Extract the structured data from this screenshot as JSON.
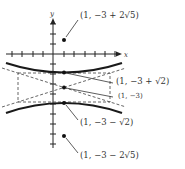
{
  "figure": {
    "type": "hyperbola-graph",
    "axes": {
      "x_label": "x",
      "y_label": "y"
    },
    "equation_center": "(1, -3)",
    "points": [
      {
        "id": "focus-top",
        "label": "(1, −3 + 2√5)"
      },
      {
        "id": "vertex-top",
        "label": "(1, −3 + √2)"
      },
      {
        "id": "center",
        "label": "(1, −3)"
      },
      {
        "id": "vertex-bottom",
        "label": "(1, −3 − √2)"
      },
      {
        "id": "focus-bottom",
        "label": "(1, −3 − 2√5)"
      }
    ]
  },
  "colors": {
    "curve": "#1a1a1a",
    "dashed": "#555555",
    "text": "#333333"
  }
}
